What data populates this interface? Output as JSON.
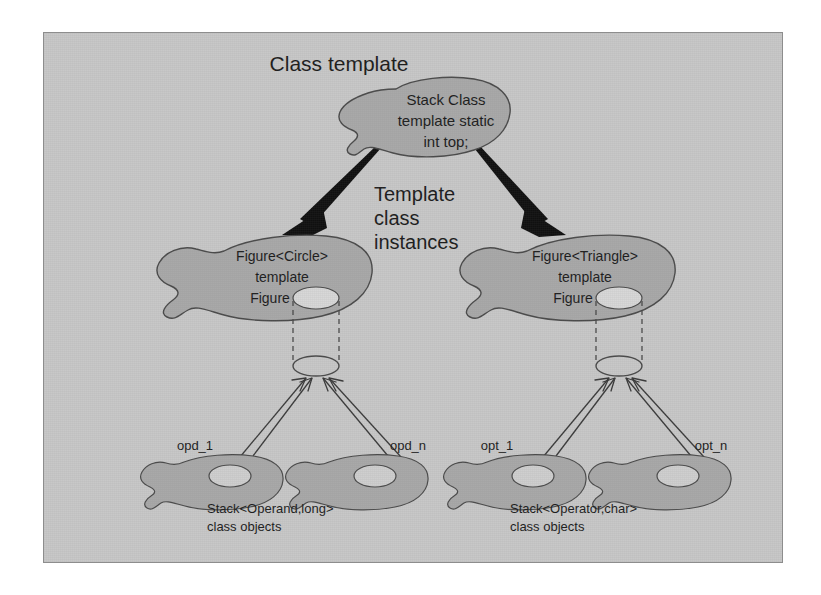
{
  "figure": {
    "title": "Class template",
    "background_color": "#c8c8c8",
    "frame_border_color": "#8d8d8d",
    "blob_fill_color": "#a9a9a9",
    "arrow_color": "#101010"
  },
  "nodes": {
    "class_template": {
      "label": "Class template",
      "blob_lines": [
        "Stack Class",
        "template static",
        "int top;"
      ]
    },
    "middle_label": {
      "lines": [
        "Template",
        "class",
        "instances"
      ]
    },
    "instance_left": {
      "blob_lines": [
        "Figure<Circle>",
        "template",
        "Figure"
      ],
      "hole_name": "figure-member-hole"
    },
    "instance_right": {
      "blob_lines": [
        "Figure<Triangle>",
        "template",
        "Figure"
      ],
      "hole_name": "figure-member-hole"
    }
  },
  "object_groups": [
    {
      "group_name": "operand-objects",
      "caption_lines": [
        "Stack<Operand,long>",
        "class objects"
      ],
      "objects": [
        {
          "label": "opd_1"
        },
        {
          "label": "opd_n"
        }
      ]
    },
    {
      "group_name": "operator-objects",
      "caption_lines": [
        "Stack<Operator,char>",
        "class objects"
      ],
      "objects": [
        {
          "label": "opt_1"
        },
        {
          "label": "opt_n"
        }
      ]
    }
  ],
  "edges": {
    "template_to_instances": "thick-black-arrow",
    "instance_to_objects": "thin-line-arrow",
    "instance_member_link": "dashed-cylinder-link"
  }
}
